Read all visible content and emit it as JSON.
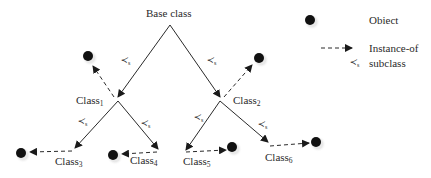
{
  "diagram": {
    "type": "class-hierarchy",
    "root": {
      "label": "Base class"
    },
    "classes": [
      {
        "id": "c1",
        "name": "Class",
        "sub": "1",
        "parent": "root",
        "relation": "≺s"
      },
      {
        "id": "c2",
        "name": "Class",
        "sub": "2",
        "parent": "root",
        "relation": "≺s"
      },
      {
        "id": "c3",
        "name": "Class",
        "sub": "3",
        "parent": "c1",
        "relation": "≺s"
      },
      {
        "id": "c4",
        "name": "Class",
        "sub": "4",
        "parent": "c1",
        "relation": "≺s"
      },
      {
        "id": "c5",
        "name": "Class",
        "sub": "5",
        "parent": "c2",
        "relation": "≺s"
      },
      {
        "id": "c6",
        "name": "Class",
        "sub": "6",
        "parent": "c2",
        "relation": "≺s"
      }
    ],
    "relation_symbol": "≺",
    "relation_subscript": "s",
    "edges": {
      "subclass": [
        [
          "root",
          "c1"
        ],
        [
          "root",
          "c2"
        ],
        [
          "c1",
          "c3"
        ],
        [
          "c1",
          "c4"
        ],
        [
          "c2",
          "c5"
        ],
        [
          "c2",
          "c6"
        ]
      ],
      "instance_of": [
        [
          "c1",
          "obj1"
        ],
        [
          "c2",
          "obj2"
        ],
        [
          "c3",
          "obj3"
        ],
        [
          "c4",
          "obj4"
        ],
        [
          "c5",
          "obj5"
        ],
        [
          "c6",
          "obj6"
        ]
      ]
    }
  },
  "legend": {
    "object_label": "Obiect",
    "instance_label": "Instance-of",
    "subclass_label": "subclass"
  },
  "colors": {
    "line": "#2a2a2a",
    "object": "#111111",
    "text": "#2a2a2a"
  }
}
